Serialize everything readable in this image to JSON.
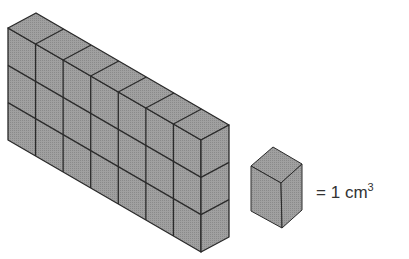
{
  "figure": {
    "prism": {
      "columns": 7,
      "rows": 3,
      "depth": 1
    },
    "legend": {
      "equals": "=",
      "value": "1",
      "unit": "cm",
      "exponent": "3"
    },
    "colors": {
      "face": "#9a9a9a",
      "edge": "#2a2a2a",
      "background": "#ffffff"
    }
  }
}
